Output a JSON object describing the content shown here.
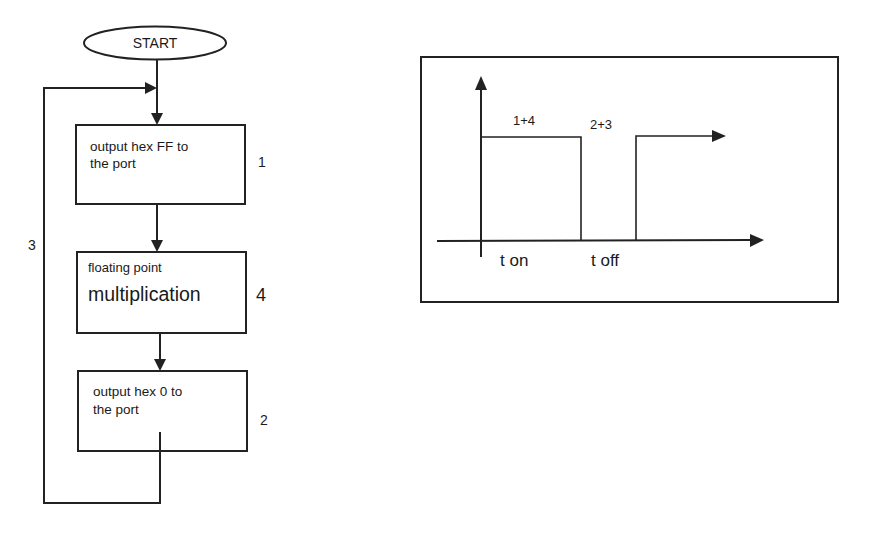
{
  "flowchart": {
    "start": {
      "label": "START"
    },
    "steps": [
      {
        "id": "1",
        "lines": [
          "output hex FF to",
          "the port"
        ],
        "number": "1"
      },
      {
        "id": "4",
        "line_small": "floating point",
        "line_big": "multiplication",
        "number": "4"
      },
      {
        "id": "2",
        "lines": [
          "output hex 0 to",
          "the port"
        ],
        "number": "2"
      }
    ],
    "loop_label": "3"
  },
  "timing_diagram": {
    "high_label": "1+4",
    "low_label": "2+3",
    "x_labels": [
      "t on",
      "t off"
    ]
  }
}
